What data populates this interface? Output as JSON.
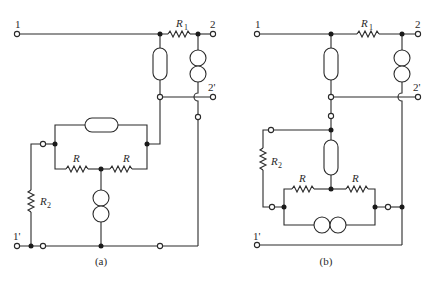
{
  "figure": {
    "colors": {
      "line": "#2a2a2a",
      "background": "#ffffff"
    },
    "circuit_a": {
      "caption": "(a)",
      "terminals": {
        "t1": "1",
        "t2": "2",
        "t2p": "2'",
        "t1p": "1'"
      },
      "resistors": {
        "r1": "R",
        "r1_sub": "1",
        "r_left": "R",
        "r_right": "R",
        "r2": "R",
        "r2_sub": "2"
      }
    },
    "circuit_b": {
      "caption": "(b)",
      "terminals": {
        "t1": "1",
        "t2": "2",
        "t2p": "2'",
        "t1p": "1'"
      },
      "resistors": {
        "r1": "R",
        "r1_sub": "1",
        "r_left": "R",
        "r_right": "R",
        "r2": "R",
        "r2_sub": "2"
      }
    }
  }
}
